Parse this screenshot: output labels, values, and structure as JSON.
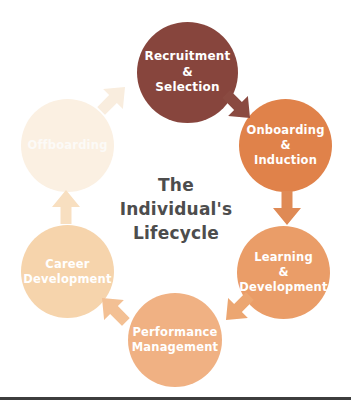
{
  "diagram": {
    "title_lines": [
      "The",
      "Individual's",
      "Lifecycle"
    ],
    "title_color": "#4d4d4d",
    "stages": [
      {
        "name": "recruitment-selection",
        "label": [
          "Recruitment",
          "&",
          "Selection"
        ],
        "color": "#87453D",
        "text_color": "#FFFFFF"
      },
      {
        "name": "onboarding-induction",
        "label": [
          "Onboarding",
          "&",
          "Induction"
        ],
        "color": "#E0824A",
        "text_color": "#FFFFFF"
      },
      {
        "name": "learning-development",
        "label": [
          "Learning",
          "&",
          "Development"
        ],
        "color": "#EA9D68",
        "text_color": "#FFFFFF"
      },
      {
        "name": "performance-management",
        "label": [
          "Performance",
          "Management"
        ],
        "color": "#F0B183",
        "text_color": "#FFFFFF"
      },
      {
        "name": "career-development",
        "label": [
          "Career",
          "Development"
        ],
        "color": "#F6D4AC",
        "text_color": "#FFFFFF"
      },
      {
        "name": "offboarding",
        "label": [
          "Offboarding"
        ],
        "color": "#FBF0E2",
        "text_color": "#FCFAF7"
      }
    ],
    "arrows": [
      {
        "name": "recruitment-to-onboarding",
        "color": "#8A4A41"
      },
      {
        "name": "onboarding-to-learning",
        "color": "#DF8A55"
      },
      {
        "name": "learning-to-performance",
        "color": "#ECA671"
      },
      {
        "name": "performance-to-career",
        "color": "#F3C094"
      },
      {
        "name": "career-to-offboarding",
        "color": "#F8DFC0"
      },
      {
        "name": "offboarding-to-recruitment",
        "color": "#F9EDDE"
      }
    ],
    "divider_color": "#3D3D3D"
  }
}
